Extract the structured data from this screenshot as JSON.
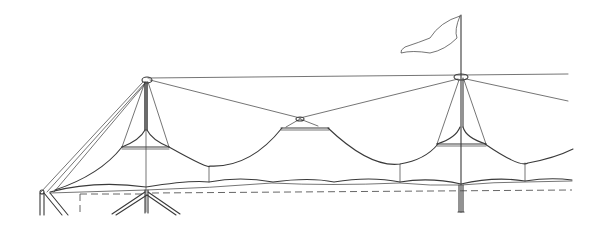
{
  "figure": {
    "type": "line-drawing",
    "colors": {
      "background": "#ffffff",
      "ink": "#3a3a3a"
    },
    "elements": {
      "masts": [
        {
          "name": "left-mast",
          "x": 146,
          "top": 78,
          "bottom": 212
        },
        {
          "name": "right-mast-with-flag",
          "x": 461,
          "top": 15,
          "bottom": 212
        }
      ],
      "center_node": {
        "x": 300,
        "y": 120
      },
      "flag": {
        "attached_to": "right-mast-with-flag"
      },
      "ground_dashed_line": {
        "y": 192
      }
    }
  }
}
